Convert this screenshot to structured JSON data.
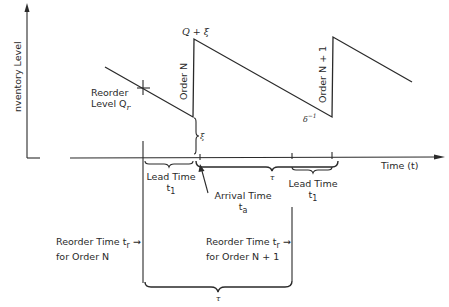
{
  "diagram": {
    "axes": {
      "y_label": "nventory Level",
      "x_label": "Time (t)"
    },
    "peaks": {
      "first_peak_label": "Q + ξ"
    },
    "orders": {
      "order_n": "Order N",
      "order_n_plus_1": "Order N + 1"
    },
    "reorder_level": {
      "line1": "Reorder",
      "line2": "Level Q",
      "subscript": "r"
    },
    "safety_stock_label": "ξ",
    "slope_label": "δ",
    "slope_exp": "−1",
    "lead_time_1": {
      "line1": "Lead Time",
      "line2": "t",
      "subscript": "1"
    },
    "lead_time_2": {
      "line1": "Lead Time",
      "line2": "t",
      "subscript": "1"
    },
    "arrival_time": {
      "line1": "Arrival Time",
      "line2": "t",
      "subscript": "a"
    },
    "tau_upper": "τ",
    "tau_lower": "τ",
    "reorder_time_n": {
      "line1": "Reorder Time t",
      "subscript": "r",
      "arrow": "→",
      "line2": "for Order N"
    },
    "reorder_time_n1": {
      "line1": "Reorder Time t",
      "subscript": "r",
      "arrow": "→",
      "line2": "for Order N + 1"
    },
    "colors": {
      "ink": "#2a2a2a",
      "background": "#ffffff"
    }
  }
}
